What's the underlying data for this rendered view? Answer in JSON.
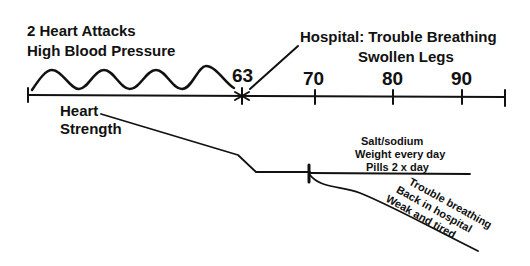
{
  "timeline": {
    "start_label_lines": [
      "2 Heart Attacks",
      "High Blood Pressure"
    ],
    "event_age": "63",
    "event_label_lines": [
      "Hospital: Trouble Breathing",
      "Swollen Legs"
    ],
    "ticks": [
      "70",
      "80",
      "90"
    ]
  },
  "heart_strength": {
    "label_lines": [
      "Heart",
      "Strength"
    ],
    "managed_branch_lines": [
      "Salt/sodium",
      "Weight every day",
      "Pills 2 x day"
    ],
    "declining_branch_lines": [
      "Trouble breathing",
      "Back in hospital",
      "Weak and tired"
    ]
  }
}
